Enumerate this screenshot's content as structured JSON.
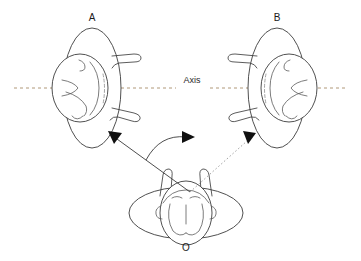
{
  "canvas": {
    "width": 361,
    "height": 261,
    "background": "#ffffff"
  },
  "diagram": {
    "type": "spatial-rotation-diagram",
    "axis": {
      "label": "Axis",
      "label_x": 192,
      "label_y": 81,
      "line_y": 88,
      "x_start": 14,
      "x_end": 347,
      "style": "dashed",
      "color": "#b09878"
    },
    "figures": [
      {
        "id": "A",
        "label": "A",
        "label_x": 92,
        "label_y": 18,
        "center_x": 92,
        "center_y": 88,
        "orientation": "profile-facing-left",
        "body_rx": 29,
        "body_ry": 60,
        "arm_side": "right",
        "description": "top-view person with vertical oval body, head at left of body, two arms extending right"
      },
      {
        "id": "B",
        "label": "B",
        "label_x": 277,
        "label_y": 18,
        "center_x": 277,
        "center_y": 88,
        "orientation": "profile-facing-right",
        "body_rx": 29,
        "body_ry": 60,
        "arm_side": "left",
        "description": "mirror image of A: head at right of body, two arms extending left"
      },
      {
        "id": "O",
        "label": "O",
        "label_x": 186,
        "label_y": 248,
        "center_x": 186,
        "center_y": 213,
        "orientation": "front-facing-viewer",
        "body_rx": 57,
        "body_ry": 26,
        "arm_side": "top",
        "description": "horizontal oval body seen from above, head centered facing viewer, two short arm stubs rising at top"
      }
    ],
    "rays": [
      {
        "name": "ray-to-a",
        "style": "solid",
        "color": "#3a3a3a",
        "from_x": 190,
        "from_y": 192,
        "to_x": 114,
        "to_y": 136,
        "arrowhead": "filled-triangle"
      },
      {
        "name": "ray-to-b",
        "style": "dotted",
        "color": "#9a9a9a",
        "from_x": 190,
        "from_y": 192,
        "to_x": 250,
        "to_y": 138,
        "arrowhead": "filled-triangle"
      }
    ],
    "arc": {
      "name": "rotation-arc",
      "style": "solid",
      "color": "#3a3a3a",
      "start_x": 146,
      "start_y": 160,
      "end_x": 188,
      "end_y": 137,
      "sweep": "clockwise-to-right",
      "arrowhead": "filled-triangle"
    }
  }
}
